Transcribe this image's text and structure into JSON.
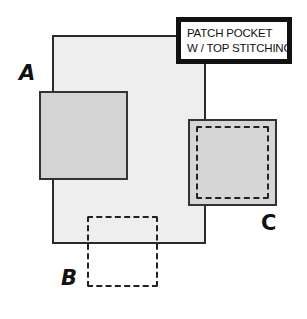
{
  "diagram": {
    "title_box": {
      "lines": [
        "PATCH POCKET",
        "W / TOP STITCHING"
      ]
    },
    "labels": {
      "a": "A",
      "b": "B",
      "c": "C"
    },
    "colors": {
      "garment_fill": "#eeeeee",
      "pocket_fill": "#d4d4d4",
      "outline": "#2a2a2a"
    }
  }
}
